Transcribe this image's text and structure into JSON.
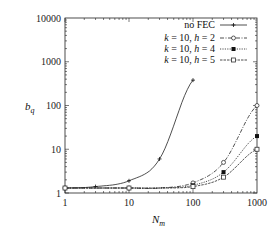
{
  "chart_data": {
    "type": "line",
    "title": "",
    "xlabel": "N_m",
    "ylabel": "b_q",
    "xscale": "log",
    "yscale": "log",
    "xlim": [
      1,
      1000
    ],
    "ylim": [
      1,
      10000
    ],
    "x_ticks": [
      "1",
      "10",
      "100",
      "1000"
    ],
    "y_ticks": [
      "1",
      "10",
      "100",
      "1000",
      "10000"
    ],
    "grid": false,
    "legend_position": "upper right",
    "series": [
      {
        "name": "no FEC",
        "style": "solid",
        "marker": "plus",
        "x": [
          1,
          3,
          10,
          30,
          100
        ],
        "y": [
          1.3,
          1.4,
          1.9,
          6,
          380
        ]
      },
      {
        "name": "k = 10, h = 2",
        "style": "dashdot",
        "marker": "circle",
        "x": [
          1,
          3,
          10,
          30,
          100,
          300,
          1000
        ],
        "y": [
          1.3,
          1.3,
          1.3,
          1.3,
          1.7,
          5,
          100
        ]
      },
      {
        "name": "k = 10, h = 4",
        "style": "dotted",
        "marker": "filled-square",
        "x": [
          1,
          3,
          10,
          30,
          100,
          300,
          1000
        ],
        "y": [
          1.3,
          1.3,
          1.3,
          1.3,
          1.5,
          3,
          20
        ]
      },
      {
        "name": "k = 10, h = 5",
        "style": "dashed-fine",
        "marker": "open-square",
        "x": [
          1,
          3,
          10,
          30,
          100,
          300,
          1000
        ],
        "y": [
          1.3,
          1.3,
          1.3,
          1.3,
          1.4,
          2.3,
          10
        ]
      }
    ]
  },
  "axes": {
    "xlabel_main": "N",
    "xlabel_sub": "m",
    "ylabel_main": "b",
    "ylabel_sub": "q"
  },
  "legend": [
    {
      "text": "no FEC"
    },
    {
      "k": "k",
      "rest1": " = 10, ",
      "h": "h",
      "rest2": " = 2"
    },
    {
      "k": "k",
      "rest1": " = 10, ",
      "h": "h",
      "rest2": " = 4"
    },
    {
      "k": "k",
      "rest1": " = 10, ",
      "h": "h",
      "rest2": " = 5"
    }
  ]
}
